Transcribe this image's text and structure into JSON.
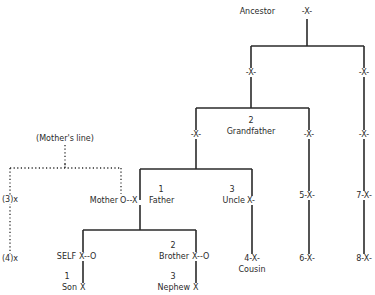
{
  "diagram": {
    "type": "kinship-tree",
    "colors": {
      "line": "#2a2a2a",
      "background": "#ffffff"
    },
    "root": {
      "label": "Ancestor",
      "marker": "-X-"
    },
    "level2": {
      "left_marker": "-X-",
      "right_marker": "-X-"
    },
    "grandfather": {
      "number": "2",
      "label": "Grandfather",
      "marker_left": "-X-",
      "marker_mid": "-X-",
      "marker_right": "-X-"
    },
    "mothers_line": {
      "label": "(Mother's line)",
      "left_top": "(3)x",
      "left_bottom": "(4)x"
    },
    "father_gen": {
      "mother_label": "Mother",
      "couple_marker": "O--X",
      "father_number": "1",
      "father_label": "Father",
      "uncle_number": "3",
      "uncle_label": "Uncle",
      "uncle_marker": "X-",
      "col5": "5-X-",
      "col7": "7-X-"
    },
    "self_gen": {
      "self_label": "SELF",
      "self_marker": "X--O",
      "brother_number": "2",
      "brother_label": "Brother",
      "brother_marker": "X--O",
      "cousin_marker": "4-X-",
      "cousin_label": "Cousin",
      "col6": "6-X-",
      "col8": "8-X-"
    },
    "child_gen": {
      "son_number": "1",
      "son_label": "Son",
      "son_marker": "X",
      "nephew_number": "3",
      "nephew_label": "Nephew",
      "nephew_marker": "X"
    }
  }
}
